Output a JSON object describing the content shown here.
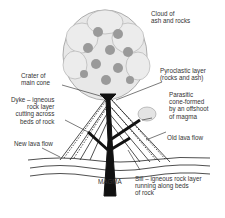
{
  "diagram": {
    "type": "volcano-cross-section",
    "labels": {
      "cloud": "Cloud of\nash and rocks",
      "crater": "Crater of\nmain cone",
      "pyroclastic": "Pyroclastic layer\n(rocks and ash)",
      "parasitic": "Parasitic\ncone-formed\nby an offshoot\nof magma",
      "dyke": "Dyke – igneous\nrock layer\ncutting across\nbeds of rock",
      "old_lava": "Old lava flow",
      "new_lava": "New lava flow",
      "magma": "MAGMA",
      "sill": "Sill – igneous rock layer\nrunning along beds\nof rock"
    },
    "colors": {
      "ink": "#1a1a1a",
      "cloud_fill": "#e6e6e6",
      "cloud_blob": "#9a9a9a",
      "background": "#ffffff"
    }
  }
}
